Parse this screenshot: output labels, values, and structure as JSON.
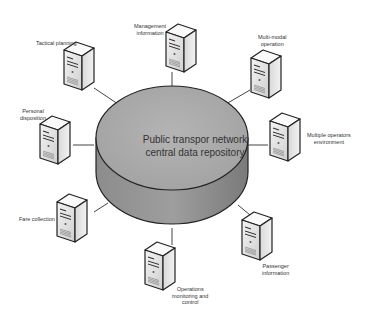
{
  "diagram": {
    "type": "hub-and-spoke network diagram",
    "central": {
      "label_line1": "Public transpor network",
      "label_line2": "central data repository",
      "shape": "cylinder",
      "fill": "#a8a8a8"
    },
    "nodes": [
      {
        "id": "tactical-planning",
        "lines": [
          "Tactical planning"
        ],
        "icon": "server-icon"
      },
      {
        "id": "management-information",
        "lines": [
          "Management",
          "information"
        ],
        "icon": "server-icon"
      },
      {
        "id": "multi-modal-operation",
        "lines": [
          "Multi-modal",
          "operation"
        ],
        "icon": "server-icon"
      },
      {
        "id": "personal-disposition",
        "lines": [
          "Personal",
          "disposition"
        ],
        "icon": "server-icon"
      },
      {
        "id": "multiple-operators-environment",
        "lines": [
          "Multiple operators",
          "environment"
        ],
        "icon": "server-icon"
      },
      {
        "id": "fare-collection",
        "lines": [
          "Fare collection"
        ],
        "icon": "server-icon"
      },
      {
        "id": "operations-monitoring-and-control",
        "lines": [
          "Operations",
          "monitoring and",
          "control"
        ],
        "icon": "server-icon"
      },
      {
        "id": "passenger-information",
        "lines": [
          "Passenger",
          "information"
        ],
        "icon": "server-icon"
      }
    ]
  }
}
